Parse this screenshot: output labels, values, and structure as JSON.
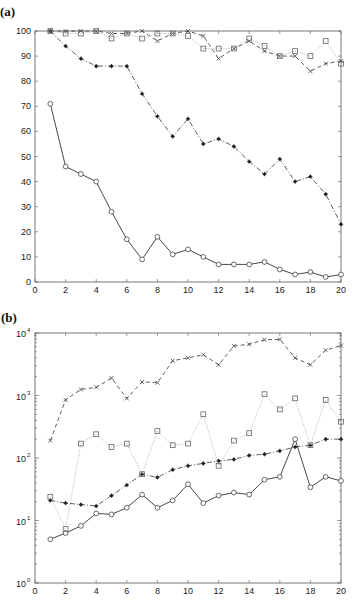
{
  "chart_data": [
    {
      "panel": "(a)",
      "type": "line",
      "title": "",
      "xlabel": "",
      "ylabel": "",
      "xlim": [
        0,
        20
      ],
      "ylim": [
        0,
        100
      ],
      "yscale": "linear",
      "xticks": [
        "0",
        "2",
        "4",
        "6",
        "8",
        "10",
        "12",
        "14",
        "16",
        "18",
        "20"
      ],
      "yticks": [
        "0",
        "10",
        "20",
        "30",
        "40",
        "50",
        "60",
        "70",
        "80",
        "90",
        "100"
      ],
      "grid": false,
      "legend": null,
      "x": [
        1,
        2,
        3,
        4,
        5,
        6,
        7,
        8,
        9,
        10,
        11,
        12,
        13,
        14,
        15,
        16,
        17,
        18,
        19,
        20
      ],
      "series": [
        {
          "name": "circle-solid",
          "marker": "circle",
          "linestyle": "solid",
          "values": [
            71,
            46,
            43,
            40,
            28,
            17,
            9,
            18,
            11,
            13,
            10,
            7,
            7,
            7,
            8,
            5,
            3,
            4,
            2,
            3
          ]
        },
        {
          "name": "star-dashdot",
          "marker": "star",
          "linestyle": "dashdot",
          "values": [
            100,
            94,
            89,
            86,
            86,
            86,
            75,
            66,
            58,
            65,
            55,
            57,
            54,
            48,
            43,
            49,
            40,
            42,
            35,
            23
          ]
        },
        {
          "name": "x-dashed",
          "marker": "x",
          "linestyle": "dashed",
          "values": [
            100,
            100,
            100,
            100,
            99,
            99,
            100,
            96,
            99,
            100,
            98,
            89,
            93,
            96,
            92,
            90,
            90,
            84,
            87,
            88
          ]
        },
        {
          "name": "square-dotted",
          "marker": "square",
          "linestyle": "dotted",
          "values": [
            100,
            99,
            99,
            100,
            97,
            99,
            97,
            99,
            99,
            98,
            93,
            93,
            93,
            97,
            94,
            90,
            92,
            90,
            96,
            87
          ]
        }
      ]
    },
    {
      "panel": "(b)",
      "type": "line",
      "title": "",
      "xlabel": "",
      "ylabel": "",
      "xlim": [
        0,
        20
      ],
      "ylim": [
        1,
        10000
      ],
      "yscale": "log",
      "xticks": [
        "0",
        "2",
        "4",
        "6",
        "8",
        "10",
        "12",
        "14",
        "16",
        "18",
        "20"
      ],
      "yticks": [
        {
          "base": "10",
          "exp": "0"
        },
        {
          "base": "10",
          "exp": "1"
        },
        {
          "base": "10",
          "exp": "2"
        },
        {
          "base": "10",
          "exp": "3"
        },
        {
          "base": "10",
          "exp": "4"
        }
      ],
      "grid": false,
      "legend": null,
      "x": [
        1,
        2,
        3,
        4,
        5,
        6,
        7,
        8,
        9,
        10,
        11,
        12,
        13,
        14,
        15,
        16,
        17,
        18,
        19,
        20
      ],
      "series": [
        {
          "name": "circle-solid",
          "marker": "circle",
          "linestyle": "solid",
          "values": [
            5,
            6.3,
            8.2,
            13,
            12.5,
            16,
            26,
            16,
            21,
            38,
            19,
            25,
            28,
            26,
            45,
            50,
            200,
            34,
            50,
            43
          ]
        },
        {
          "name": "star-dashdot",
          "marker": "star",
          "linestyle": "dashdot",
          "values": [
            21,
            19,
            18,
            17,
            25,
            37,
            55,
            49,
            65,
            75,
            82,
            90,
            95,
            110,
            115,
            130,
            150,
            160,
            200,
            200
          ]
        },
        {
          "name": "x-dashed",
          "marker": "x",
          "linestyle": "dashed",
          "values": [
            190,
            850,
            1250,
            1350,
            1900,
            900,
            1650,
            1600,
            3600,
            4000,
            4500,
            3100,
            6200,
            6600,
            7800,
            7900,
            4000,
            3100,
            5300,
            6300
          ]
        },
        {
          "name": "square-dotted",
          "marker": "square",
          "linestyle": "dotted",
          "values": [
            24,
            7.3,
            170,
            240,
            150,
            170,
            55,
            270,
            160,
            170,
            500,
            75,
            190,
            250,
            1050,
            600,
            900,
            160,
            850,
            380
          ]
        }
      ]
    }
  ],
  "panels": {
    "a": {
      "label": "(a)"
    },
    "b": {
      "label": "(b)"
    }
  }
}
